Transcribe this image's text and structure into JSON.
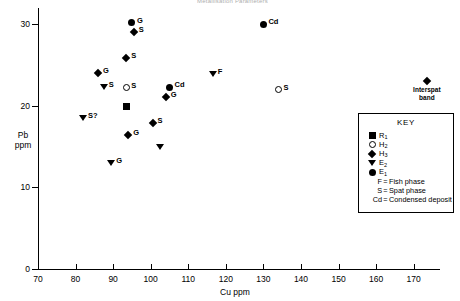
{
  "title": "Metallisation Parameters",
  "chart_data": {
    "type": "scatter",
    "title": "Metallisation Parameters",
    "xlabel": "Cu ppm",
    "ylabel": "Pb ppm",
    "xlim": [
      70,
      177
    ],
    "ylim": [
      0,
      32
    ],
    "xticks": [
      70,
      80,
      90,
      100,
      110,
      120,
      130,
      140,
      150,
      160,
      170
    ],
    "yticks": [
      0,
      10,
      20,
      30
    ],
    "grid": false,
    "legend_position": "right-middle",
    "points": [
      {
        "x": 95.0,
        "y": 30.2,
        "marker": "circle-filled",
        "label": "G",
        "label_pos": "right"
      },
      {
        "x": 95.5,
        "y": 29.0,
        "marker": "diamond",
        "label": "S",
        "label_pos": "right"
      },
      {
        "x": 130.0,
        "y": 30.0,
        "marker": "circle-filled",
        "label": "Cd",
        "label_pos": "right"
      },
      {
        "x": 173.5,
        "y": 23.0,
        "marker": "diamond",
        "label": "Interspat band",
        "label_pos": "below"
      },
      {
        "x": 93.5,
        "y": 25.9,
        "marker": "diamond",
        "label": "S",
        "label_pos": "right"
      },
      {
        "x": 86.0,
        "y": 24.0,
        "marker": "diamond",
        "label": "G",
        "label_pos": "right"
      },
      {
        "x": 87.5,
        "y": 22.3,
        "marker": "triangle-down",
        "label": "S",
        "label_pos": "right"
      },
      {
        "x": 93.5,
        "y": 22.2,
        "marker": "circle-open",
        "label": "S",
        "label_pos": "right"
      },
      {
        "x": 105.0,
        "y": 22.3,
        "marker": "circle-filled",
        "label": "Cd",
        "label_pos": "right"
      },
      {
        "x": 116.5,
        "y": 23.9,
        "marker": "triangle-down",
        "label": "F",
        "label_pos": "right"
      },
      {
        "x": 134.0,
        "y": 22.0,
        "marker": "circle-open",
        "label": "S",
        "label_pos": "right"
      },
      {
        "x": 104.0,
        "y": 21.1,
        "marker": "diamond",
        "label": "G",
        "label_pos": "right"
      },
      {
        "x": 93.5,
        "y": 19.9,
        "marker": "square",
        "label": "",
        "label_pos": "right"
      },
      {
        "x": 82.0,
        "y": 18.5,
        "marker": "triangle-down",
        "label": "S?",
        "label_pos": "right"
      },
      {
        "x": 100.5,
        "y": 17.9,
        "marker": "diamond",
        "label": "S",
        "label_pos": "right"
      },
      {
        "x": 94.0,
        "y": 16.4,
        "marker": "diamond",
        "label": "G",
        "label_pos": "right"
      },
      {
        "x": 102.5,
        "y": 14.9,
        "marker": "triangle-down",
        "label": "",
        "label_pos": "right"
      },
      {
        "x": 89.5,
        "y": 13.0,
        "marker": "triangle-down",
        "label": "G",
        "label_pos": "right"
      }
    ]
  },
  "legend": {
    "title": "KEY",
    "symbol_entries": [
      {
        "marker": "square",
        "base": "R",
        "sub": "1"
      },
      {
        "marker": "circle-open",
        "base": "H",
        "sub": "2"
      },
      {
        "marker": "diamond",
        "base": "H",
        "sub": "3"
      },
      {
        "marker": "triangle-down",
        "base": "E",
        "sub": "2"
      },
      {
        "marker": "circle-filled",
        "base": "E",
        "sub": "1"
      }
    ],
    "text_entries": [
      {
        "key": "F",
        "eq": "=",
        "desc": "Fish phase"
      },
      {
        "key": "S",
        "eq": "=",
        "desc": "Spat phase"
      },
      {
        "key": "Cd",
        "eq": "=",
        "desc": "Condensed deposit"
      }
    ]
  }
}
